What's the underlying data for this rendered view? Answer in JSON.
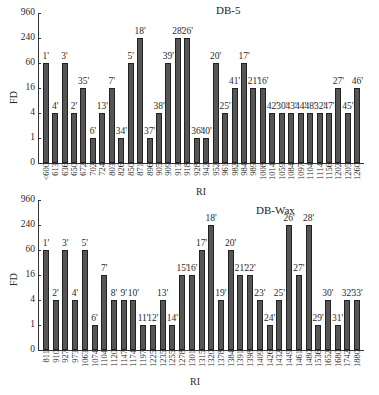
{
  "chart_data": [
    {
      "type": "bar",
      "title": "DB-5",
      "xlabel": "RI",
      "ylabel": "FD",
      "yscale": "log4",
      "yticks": [
        "0",
        "1",
        "4",
        "16",
        "60",
        "240",
        "960"
      ],
      "ylim": [
        0,
        960
      ],
      "grid": false,
      "categories": [
        "<600",
        "613",
        "636",
        "650",
        "672",
        "702",
        "724",
        "803",
        "826",
        "850",
        "871",
        "896",
        "905",
        "909",
        "913",
        "918",
        "928",
        "942",
        "952",
        "961",
        "982",
        "984",
        "989",
        "1008",
        "1014",
        "1059",
        "1084",
        "1097",
        "1104",
        "1114",
        "1156",
        "1202",
        "1205",
        "1260"
      ],
      "bar_labels": [
        "1'",
        "4'",
        "3'",
        "2'",
        "35'",
        "6'",
        "13'",
        "7'",
        "34'",
        "5'",
        "18'",
        "37'",
        "38'",
        "39'",
        "28'",
        "26'",
        "36'",
        "40'",
        "20'",
        "25'",
        "41'",
        "17'",
        "21'",
        "16'",
        "42'",
        "30'",
        "43'",
        "44'",
        "48'",
        "32'",
        "47'",
        "27'",
        "45'",
        "46'"
      ],
      "values": [
        60,
        4,
        60,
        4,
        16,
        1,
        4,
        16,
        1,
        60,
        240,
        1,
        4,
        60,
        240,
        240,
        1,
        1,
        60,
        4,
        16,
        60,
        16,
        16,
        4,
        4,
        4,
        4,
        4,
        4,
        4,
        16,
        4,
        16
      ]
    },
    {
      "type": "bar",
      "title": "DB-Wax",
      "xlabel": "RI",
      "ylabel": "FD",
      "yscale": "log4",
      "yticks": [
        "0",
        "1",
        "4",
        "16",
        "60",
        "240",
        "960"
      ],
      "ylim": [
        0,
        960
      ],
      "grid": false,
      "categories": [
        "811",
        "910",
        "927",
        "973",
        "1063",
        "1074",
        "1104",
        "1120",
        "1147",
        "1174",
        "1197",
        "1225",
        "1235",
        "1255",
        "1278",
        "1301",
        "1315",
        "1320",
        "1378",
        "1384",
        "1391",
        "1398",
        "1409",
        "1426",
        "1432",
        "1449",
        "1461",
        "1480",
        "1536",
        "1652",
        "1680",
        "1742",
        "1880"
      ],
      "bar_labels": [
        "1'",
        "2'",
        "3'",
        "4'",
        "5'",
        "6'",
        "7'",
        "8'",
        "9'",
        "10'",
        "11'",
        "12'",
        "13'",
        "14'",
        "15'",
        "16'",
        "17'",
        "18'",
        "19'",
        "20'",
        "21'",
        "22'",
        "23'",
        "24'",
        "25'",
        "26'",
        "27'",
        "28'",
        "29'",
        "30'",
        "31'",
        "32'",
        "33'"
      ],
      "values": [
        60,
        4,
        60,
        4,
        60,
        1,
        16,
        4,
        4,
        4,
        1,
        1,
        4,
        1,
        16,
        16,
        60,
        240,
        4,
        60,
        16,
        16,
        4,
        1,
        4,
        240,
        16,
        240,
        1,
        4,
        1,
        4,
        4
      ]
    }
  ]
}
